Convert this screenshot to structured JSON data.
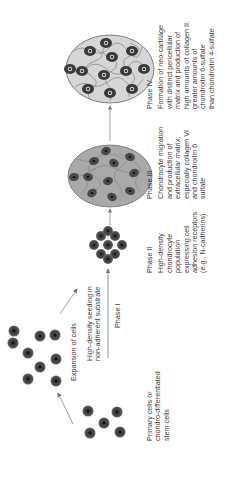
{
  "diagram": {
    "stages": [
      {
        "id": "primary",
        "label_lines": [
          "Primary cells or",
          "chondro-differentiated",
          "stem cells"
        ]
      },
      {
        "id": "expansion",
        "label": "Expansion of cells"
      },
      {
        "id": "phase1",
        "arrow_label_lines": [
          "High-density seeding in",
          "non-adherent substrate"
        ],
        "phase": "Phase I"
      },
      {
        "id": "phase2",
        "phase": "Phase II",
        "description_lines": [
          "High-density",
          "chondrocyte",
          "population",
          "expressing cell",
          "adhesion receptors",
          "(e.g., N-cadherins)"
        ]
      },
      {
        "id": "phase3",
        "phase": "Phase III",
        "description_lines": [
          "Chondrocyte migration",
          "and production of",
          "extracellular matrix,",
          "especially collagen VI",
          "and chondroitin 6",
          "sulfate"
        ]
      },
      {
        "id": "phase4",
        "phase": "Phase IV",
        "description_lines": [
          "Formation of neo-cartilage",
          "with distinct pericellular",
          "matrix and production of",
          "high amounts of collagen II;",
          "greater amounts of",
          "chondroitin 6-sulfate",
          "than chondroitin 4-sulfate"
        ]
      }
    ],
    "colors": {
      "cell_fill": "#4a4a4a",
      "cell_nucleus": "#1e1e1e",
      "phase3_matrix": "#a9a9a9",
      "phase4_matrix": "#d6d6d6",
      "arrow": "#7a7a7a",
      "text": "#3c3c3c"
    }
  }
}
